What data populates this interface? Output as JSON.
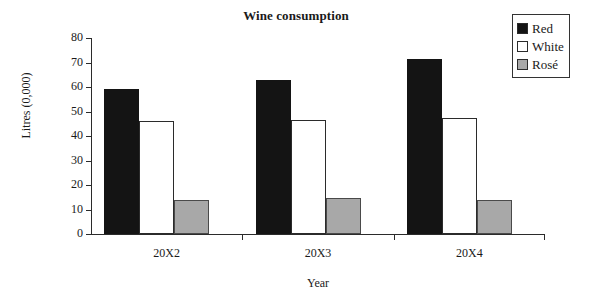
{
  "chart_data": {
    "type": "bar",
    "title": "Wine consumption",
    "xlabel": "Year",
    "ylabel": "Litres (0,000)",
    "categories": [
      "20X2",
      "20X3",
      "20X4"
    ],
    "series": [
      {
        "name": "Red",
        "color": "#141414",
        "values": [
          59,
          63,
          71.5
        ]
      },
      {
        "name": "White",
        "color": "#ffffff",
        "values": [
          46,
          46.5,
          47.5
        ]
      },
      {
        "name": "Rosé",
        "color": "#a8a8a8",
        "values": [
          14,
          14.5,
          14
        ]
      }
    ],
    "ylim": [
      0,
      80
    ],
    "yticks": [
      0,
      10,
      20,
      30,
      40,
      50,
      60,
      70,
      80
    ],
    "ytick_labels": [
      "0",
      "10",
      "20",
      "30",
      "40",
      "50",
      "60",
      "70",
      "80"
    ],
    "grid": false,
    "legend_position": "top-right"
  },
  "legend": {
    "items": [
      {
        "label": "Red",
        "swatch": "swatch-red"
      },
      {
        "label": "White",
        "swatch": "swatch-white"
      },
      {
        "label": "Rosé",
        "swatch": "swatch-rose"
      }
    ]
  },
  "colors": {
    "red": "#141414",
    "white": "#ffffff",
    "rose": "#a8a8a8",
    "axis": "#2b2b2b",
    "text": "#1a1a1a"
  }
}
